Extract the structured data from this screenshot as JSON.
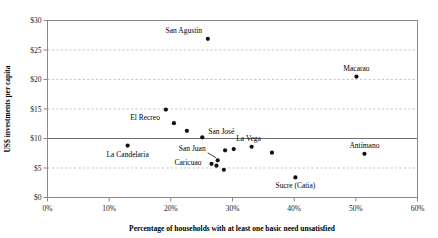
{
  "chart_data": {
    "type": "scatter",
    "title": "",
    "xlabel": "Percentage of households with at least one basic need unsatisfied",
    "ylabel": "US$ investments per capita",
    "xlim": [
      0,
      60
    ],
    "ylim": [
      0,
      30
    ],
    "xtick_labels": [
      "0%",
      "10%",
      "20%",
      "30%",
      "40%",
      "50%",
      "60%"
    ],
    "xtick_values": [
      0,
      10,
      20,
      30,
      40,
      50,
      60
    ],
    "ytick_labels": [
      "$0",
      "$5",
      "$10",
      "$15",
      "$20",
      "$25",
      "$30"
    ],
    "ytick_values": [
      0,
      5,
      10,
      15,
      20,
      25,
      30
    ],
    "grid": "horizontal-dashed",
    "legend": "none",
    "reference_line": {
      "axis": "y",
      "value": 10,
      "style": "solid"
    },
    "marker_color": "#111111",
    "grid_color": "#b9b9b9",
    "frame_color": "#8a8a8a",
    "points": [
      {
        "name": "San Agustin",
        "x": 26.0,
        "y": 26.9,
        "label": "San Agustin",
        "label_dx": -24,
        "label_dy": -6,
        "label_anchor": "middle"
      },
      {
        "name": "Macarao",
        "x": 50.1,
        "y": 20.5,
        "label": "Macarao",
        "label_dx": 0,
        "label_dy": -6,
        "label_anchor": "middle"
      },
      {
        "name": "unlabeled-1",
        "x": 19.2,
        "y": 14.9,
        "label": "",
        "label_dx": 0,
        "label_dy": 0,
        "label_anchor": "middle"
      },
      {
        "name": "El Recreo",
        "x": 20.5,
        "y": 12.6,
        "label": "El Recreo",
        "label_dx": -14,
        "label_dy": -3,
        "label_anchor": "end"
      },
      {
        "name": "unlabeled-2",
        "x": 22.6,
        "y": 11.3,
        "label": "",
        "label_dx": 0,
        "label_dy": 0,
        "label_anchor": "middle"
      },
      {
        "name": "San Jose",
        "x": 25.1,
        "y": 10.2,
        "label": "San José",
        "label_dx": 6,
        "label_dy": -3,
        "label_anchor": "start"
      },
      {
        "name": "La Candelaria",
        "x": 13.0,
        "y": 8.8,
        "label": "La Candelaria",
        "label_dx": 0,
        "label_dy": 11,
        "label_anchor": "middle"
      },
      {
        "name": "unlabeled-3",
        "x": 28.8,
        "y": 8.0,
        "label": "",
        "label_dx": 0,
        "label_dy": 0,
        "label_anchor": "middle"
      },
      {
        "name": "San Juan",
        "x": 27.6,
        "y": 6.3,
        "label": "San Juan",
        "label_dx": -12,
        "label_dy": -9,
        "label_anchor": "end",
        "leader": true
      },
      {
        "name": "Caricuao",
        "x": 26.6,
        "y": 5.7,
        "label": "Caricuao",
        "label_dx": -10,
        "label_dy": 1,
        "label_anchor": "end"
      },
      {
        "name": "unlabeled-4",
        "x": 27.4,
        "y": 5.4,
        "label": "",
        "label_dx": 0,
        "label_dy": 0,
        "label_anchor": "middle"
      },
      {
        "name": "unlabeled-5",
        "x": 28.6,
        "y": 4.7,
        "label": "",
        "label_dx": 0,
        "label_dy": 0,
        "label_anchor": "middle"
      },
      {
        "name": "unlabeled-6",
        "x": 30.2,
        "y": 8.2,
        "label": "",
        "label_dx": 0,
        "label_dy": 0,
        "label_anchor": "middle"
      },
      {
        "name": "La Vega",
        "x": 33.1,
        "y": 8.6,
        "label": "La Vega",
        "label_dx": -3,
        "label_dy": -6,
        "label_anchor": "middle"
      },
      {
        "name": "unlabeled-7",
        "x": 36.4,
        "y": 7.6,
        "label": "",
        "label_dx": 0,
        "label_dy": 0,
        "label_anchor": "middle"
      },
      {
        "name": "Antimano",
        "x": 51.4,
        "y": 7.4,
        "label": "Antímano",
        "label_dx": 0,
        "label_dy": -6,
        "label_anchor": "middle"
      },
      {
        "name": "Sucre (Catia)",
        "x": 40.2,
        "y": 3.4,
        "label": "Sucre (Catia)",
        "label_dx": 0,
        "label_dy": 11,
        "label_anchor": "middle"
      }
    ]
  }
}
